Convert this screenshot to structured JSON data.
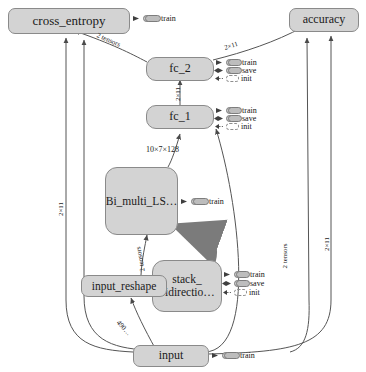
{
  "diagram": {
    "type": "tensorflow-computational-graph",
    "background": "#ffffff",
    "node_fill": "#d3d3d3",
    "node_stroke": "#8a8a8a",
    "edge_color": "#555555",
    "highlight_edge_color": "#6f6f6f"
  },
  "nodes": [
    {
      "id": "cross_entropy",
      "label": "cross_entropy",
      "shape": "pill"
    },
    {
      "id": "accuracy",
      "label": "accuracy",
      "shape": "pill"
    },
    {
      "id": "fc_2",
      "label": "fc_2",
      "shape": "block"
    },
    {
      "id": "fc_1",
      "label": "fc_1",
      "shape": "block"
    },
    {
      "id": "bi_multi_lstm",
      "label": "Bi_multi_LS…",
      "shape": "big"
    },
    {
      "id": "stack_bidir",
      "label": "stack_\nbidirectio…",
      "shape": "big"
    },
    {
      "id": "input_reshape",
      "label": "input_reshape",
      "shape": "pill"
    },
    {
      "id": "input",
      "label": "input",
      "shape": "pill"
    }
  ],
  "op_badges": [
    {
      "owner": "cross_entropy",
      "items": [
        "train"
      ]
    },
    {
      "owner": "fc_2",
      "items": [
        "train",
        "save",
        "init"
      ]
    },
    {
      "owner": "fc_1",
      "items": [
        "train",
        "save",
        "init"
      ]
    },
    {
      "owner": "bi_multi_lstm",
      "items": [
        "train"
      ]
    },
    {
      "owner": "stack_bidir",
      "items": [
        "train",
        "save",
        "init"
      ]
    },
    {
      "owner": "input",
      "items": [
        "train"
      ]
    }
  ],
  "badge_labels": {
    "train": "train",
    "save": "save",
    "init": "init"
  },
  "edge_labels": [
    {
      "id": "fc2_to_cross_entropy",
      "text": "2 tensors"
    },
    {
      "id": "fc2_to_accuracy",
      "text": "2×11"
    },
    {
      "id": "fc1_to_fc2",
      "text": "2×11"
    },
    {
      "id": "bilstm_to_fc1",
      "text": "10×7×128"
    },
    {
      "id": "reshape_to_bilstm",
      "text": "2 tensors"
    },
    {
      "id": "input_to_reshape",
      "text": "490…"
    },
    {
      "id": "input_to_fc1",
      "text": "2 tensors"
    },
    {
      "id": "input_to_accuracy",
      "text": "2×11"
    },
    {
      "id": "input_to_cross_entropy",
      "text": "2×11"
    }
  ]
}
